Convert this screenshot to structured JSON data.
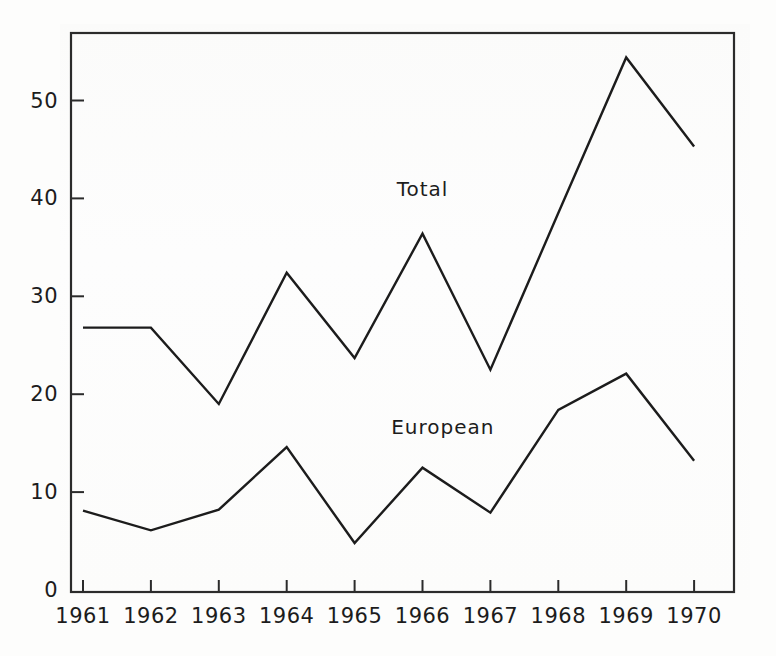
{
  "chart_data": {
    "type": "line",
    "title": "",
    "subtitle": "",
    "xlabel": "",
    "ylabel": "",
    "categories": [
      "1961",
      "1962",
      "1963",
      "1964",
      "1965",
      "1966",
      "1967",
      "1968",
      "1969",
      "1970"
    ],
    "x": [
      1961,
      1962,
      1963,
      1964,
      1965,
      1966,
      1967,
      1968,
      1969,
      1970
    ],
    "xlim": [
      1960.7,
      1970.6
    ],
    "ylim": [
      0,
      57
    ],
    "yticks": [
      0,
      10,
      20,
      30,
      40,
      50
    ],
    "ytick_labels": [
      "0",
      "10",
      "20",
      "30",
      "40",
      "50"
    ],
    "xtick_labels": [
      "1961",
      "1962",
      "1963",
      "1964",
      "1965",
      "1966",
      "1967",
      "1968",
      "1969",
      "1970"
    ],
    "grid": false,
    "legend_position": "inline-annotation",
    "series": [
      {
        "name": "Total",
        "label_text": "Total",
        "color": "#1c1c1c",
        "values": [
          26.8,
          26.8,
          19.0,
          32.4,
          23.7,
          36.4,
          22.5,
          38.5,
          54.4,
          45.3
        ]
      },
      {
        "name": "European",
        "label_text": "European",
        "color": "#1c1c1c",
        "values": [
          8.1,
          6.1,
          8.2,
          14.6,
          4.8,
          12.5,
          7.9,
          18.4,
          22.1,
          13.2
        ]
      }
    ],
    "annotations": [
      {
        "text": "Total",
        "x": 1966.0,
        "y": 41.0
      },
      {
        "text": "European",
        "x": 1966.3,
        "y": 16.6
      }
    ]
  },
  "axes": {
    "frame_color": "#2b2b2b",
    "line_color": "#1c1c1c",
    "background": "#fdfdfc"
  }
}
